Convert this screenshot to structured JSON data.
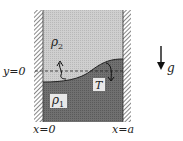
{
  "diagram": {
    "fluids": {
      "upper": {
        "label": "ρ",
        "subscript": "2",
        "color": "#c4c4c4"
      },
      "lower": {
        "label": "ρ",
        "subscript": "1",
        "color": "#6a6a6a"
      }
    },
    "interface_label": "T",
    "reference_line_label": "y=0",
    "walls": {
      "left_label": "x=0",
      "right_label": "x=a"
    },
    "gravity_label": "g"
  }
}
